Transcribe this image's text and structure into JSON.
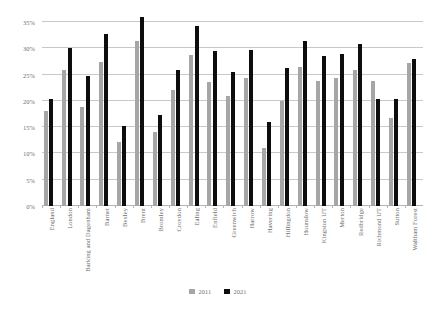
{
  "chart_data": {
    "type": "bar",
    "title": "",
    "subtitle": "",
    "xlabel": "",
    "ylabel": "",
    "ylim": [
      0,
      35
    ],
    "ytick_labels": [
      "0%",
      "5%",
      "10%",
      "15%",
      "20%",
      "25%",
      "30%",
      "35%"
    ],
    "ytick_values": [
      0,
      5,
      10,
      15,
      20,
      25,
      30,
      35
    ],
    "grid": true,
    "legend_position": "bottom",
    "categories": [
      "England",
      "London",
      "Barking and Dagenham",
      "Barnet",
      "Bexley",
      "Brent",
      "Bromley",
      "Croydon",
      "Ealing",
      "Enfield",
      "Greenwich",
      "Harrow",
      "Havering",
      "Hillingdon",
      "Hounslow",
      "Kingston UT",
      "Merton",
      "Redbridge",
      "Richmond UT",
      "Sutton",
      "Waltham Forest"
    ],
    "series": [
      {
        "name": "2011",
        "color": "#a6a6a6",
        "values": [
          18.0,
          25.9,
          18.8,
          27.3,
          12.1,
          31.3,
          14.1,
          22.0,
          28.8,
          23.6,
          21.0,
          24.3,
          11.0,
          20.0,
          26.4,
          23.8,
          24.4,
          25.8,
          23.7,
          16.8,
          27.2
        ]
      },
      {
        "name": "2021",
        "color": "#0d0d0d",
        "values": [
          20.3,
          30.0,
          24.7,
          32.8,
          15.2,
          36.0,
          17.3,
          25.8,
          34.2,
          29.5,
          25.5,
          29.6,
          16.0,
          26.2,
          31.3,
          28.5,
          28.9,
          30.8,
          20.4,
          20.4,
          28.0
        ]
      }
    ]
  },
  "legend": {
    "entries": [
      {
        "label": "2011",
        "color": "#a6a6a6"
      },
      {
        "label": "2021",
        "color": "#0d0d0d"
      }
    ]
  }
}
